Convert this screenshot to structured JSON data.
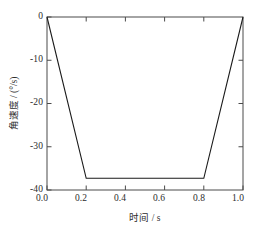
{
  "chart_data": {
    "type": "line",
    "title": "",
    "xlabel": "时间 / s",
    "ylabel": "角速度 / (°/s)",
    "xlim": [
      0.0,
      1.0
    ],
    "ylim": [
      -40,
      0
    ],
    "grid": false,
    "legend": null,
    "xticks": [
      0.0,
      0.2,
      0.4,
      0.6,
      0.8,
      1.0
    ],
    "xtick_labels": [
      "0.0",
      "0.2",
      "0.4",
      "0.6",
      "0.8",
      "1.0"
    ],
    "yticks": [
      0,
      -10,
      -20,
      -30,
      -40
    ],
    "ytick_labels": [
      "0",
      "-10",
      "-20",
      "-30",
      "-40"
    ],
    "series": [
      {
        "name": "角速度",
        "color": "#1a1a1a",
        "x": [
          0.0,
          0.2,
          0.8,
          1.0
        ],
        "values": [
          0.0,
          -37.3,
          -37.3,
          0.0
        ]
      }
    ]
  },
  "axis": {
    "x_label": "时间 / s",
    "y_label": "角速度 / (°/s)",
    "x_ticks": [
      "0.0",
      "0.2",
      "0.4",
      "0.6",
      "0.8",
      "1.0"
    ],
    "y_ticks": [
      "0",
      "-10",
      "-20",
      "-30",
      "-40"
    ]
  }
}
